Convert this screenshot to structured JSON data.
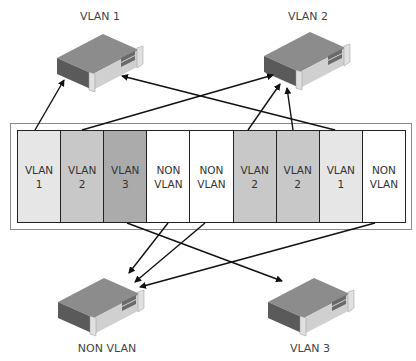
{
  "servers": [
    {
      "id": "vlan1",
      "label": "VLAN 1"
    },
    {
      "id": "vlan2",
      "label": "VLAN 2"
    },
    {
      "id": "nonvlan",
      "label": "NON VLAN"
    },
    {
      "id": "vlan3",
      "label": "VLAN 3"
    }
  ],
  "ports": [
    {
      "line1": "VLAN",
      "line2": "1",
      "color": "#e6e6e6"
    },
    {
      "line1": "VLAN",
      "line2": "2",
      "color": "#c8c8c8"
    },
    {
      "line1": "VLAN",
      "line2": "3",
      "color": "#ababab"
    },
    {
      "line1": "NON",
      "line2": "VLAN",
      "color": "#ffffff"
    },
    {
      "line1": "NON",
      "line2": "VLAN",
      "color": "#ffffff"
    },
    {
      "line1": "VLAN",
      "line2": "2",
      "color": "#c8c8c8"
    },
    {
      "line1": "VLAN",
      "line2": "2",
      "color": "#c8c8c8"
    },
    {
      "line1": "VLAN",
      "line2": "1",
      "color": "#e6e6e6"
    },
    {
      "line1": "NON",
      "line2": "VLAN",
      "color": "#ffffff"
    }
  ],
  "connections": [
    {
      "from_port": 1,
      "to": "VLAN 1"
    },
    {
      "from_port": 2,
      "to": "VLAN 2"
    },
    {
      "from_port": 3,
      "to": "VLAN 3"
    },
    {
      "from_port": 4,
      "to": "NON VLAN"
    },
    {
      "from_port": 5,
      "to": "NON VLAN"
    },
    {
      "from_port": 6,
      "to": "VLAN 2"
    },
    {
      "from_port": 7,
      "to": "VLAN 2"
    },
    {
      "from_port": 8,
      "to": "VLAN 1"
    },
    {
      "from_port": 9,
      "to": "NON VLAN"
    }
  ]
}
